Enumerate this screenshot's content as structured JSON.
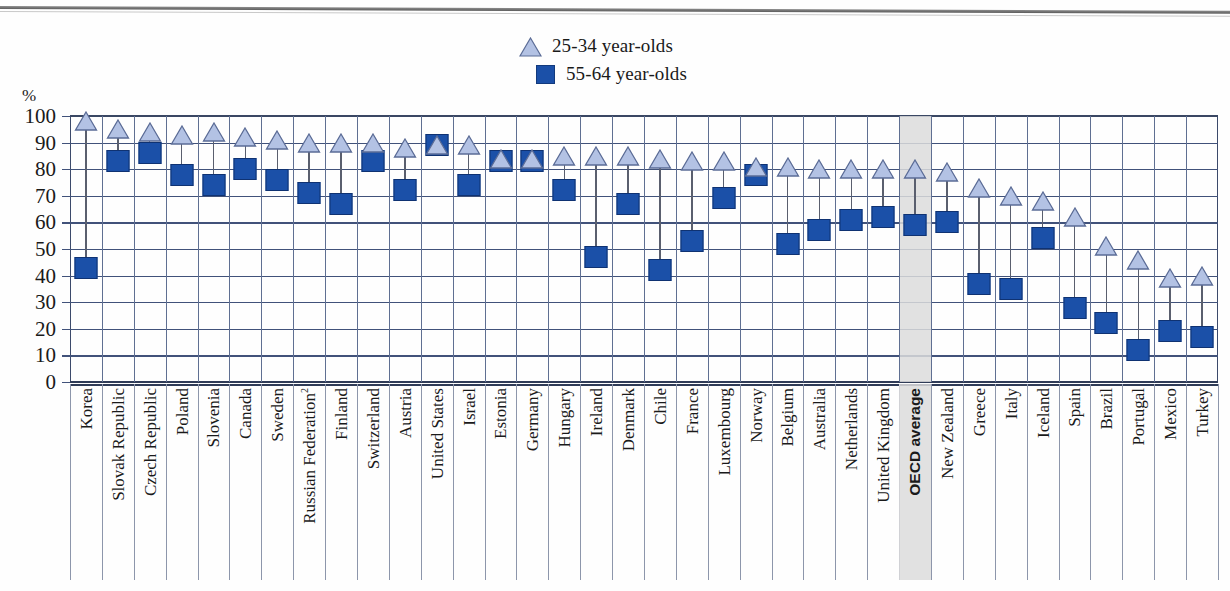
{
  "chart_data": {
    "type": "scatter",
    "title": "",
    "xlabel": "",
    "ylabel": "%",
    "ylim": [
      0,
      100
    ],
    "ytick_step": 10,
    "yticks": [
      100,
      90,
      80,
      70,
      60,
      50,
      40,
      30,
      20,
      10,
      0
    ],
    "grid": true,
    "legend_position": "top-center",
    "highlight_category": "OECD average",
    "colors": {
      "series_25_34": "#b3c2e4",
      "series_55_64": "#1b50a8",
      "stem": "#5a5f6e",
      "grid": "#5a6a8c",
      "highlight_band": "#dcdcdc"
    },
    "legend": [
      {
        "label": "25-34 year-olds",
        "marker": "triangle",
        "color": "#b3c2e4"
      },
      {
        "label": "55-64 year-olds",
        "marker": "square",
        "color": "#1b50a8"
      }
    ],
    "categories": [
      "Korea",
      "Slovak Republic",
      "Czech Republic",
      "Poland",
      "Slovenia",
      "Canada",
      "Sweden",
      "Russian Federation",
      "Finland",
      "Switzerland",
      "Austria",
      "United States",
      "Israel",
      "Estonia",
      "Germany",
      "Hungary",
      "Ireland",
      "Denmark",
      "Chile",
      "France",
      "Luxembourg",
      "Norway",
      "Belgium",
      "Australia",
      "Netherlands",
      "United Kingdom",
      "OECD average",
      "New Zealand",
      "Greece",
      "Italy",
      "Iceland",
      "Spain",
      "Brazil",
      "Portugal",
      "Mexico",
      "Turkey"
    ],
    "category_footnotes": {
      "Russian Federation": "2"
    },
    "series": [
      {
        "name": "25-34 year-olds",
        "values": [
          98,
          95,
          94,
          93,
          94,
          92,
          91,
          90,
          90,
          90,
          88,
          89,
          89,
          84,
          84,
          85,
          85,
          85,
          84,
          83,
          83,
          81,
          81,
          80,
          80,
          80,
          80,
          79,
          73,
          70,
          68,
          62,
          51,
          46,
          39,
          40
        ]
      },
      {
        "name": "55-64 year-olds",
        "values": [
          43,
          83,
          86,
          78,
          74,
          80,
          76,
          71,
          67,
          83,
          72,
          89,
          74,
          83,
          83,
          72,
          47,
          67,
          42,
          53,
          69,
          78,
          52,
          57,
          61,
          62,
          59,
          60,
          37,
          35,
          54,
          28,
          22,
          12,
          19,
          17
        ]
      }
    ]
  }
}
